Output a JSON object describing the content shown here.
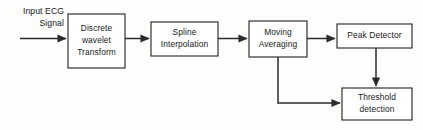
{
  "diagram": {
    "type": "flowchart",
    "background_color": "#fdfdfc",
    "line_color": "#2b2b2b",
    "text_color": "#181818",
    "source": {
      "name": "input-signal-label",
      "line1": "Input ECG",
      "line2": "Signal"
    },
    "blocks": [
      {
        "id": "discrete-wavelet-transform",
        "line1": "Discrete",
        "line2": "wavelet",
        "line3": "Transform",
        "x": 68,
        "y": 14,
        "w": 57,
        "h": 54
      },
      {
        "id": "spline-interpolation",
        "line1": "Spline",
        "line2": "Interpolation",
        "line3": "",
        "x": 151,
        "y": 22,
        "w": 67,
        "h": 34
      },
      {
        "id": "moving-averaging",
        "line1": "Moving",
        "line2": "Averaging",
        "line3": "",
        "x": 249,
        "y": 21,
        "w": 58,
        "h": 36
      },
      {
        "id": "peak-detector",
        "line1": "Peak Detector",
        "line2": "",
        "line3": "",
        "x": 337,
        "y": 24,
        "w": 75,
        "h": 24
      },
      {
        "id": "threshold-detection",
        "line1": "Threshold",
        "line2": "detection",
        "line3": "",
        "x": 342,
        "y": 88,
        "w": 70,
        "h": 32
      }
    ],
    "connections": [
      {
        "id": "input-to-dwt",
        "from": "input",
        "to": "discrete-wavelet-transform"
      },
      {
        "id": "dwt-to-spline",
        "from": "discrete-wavelet-transform",
        "to": "spline-interpolation"
      },
      {
        "id": "spline-to-moving-averaging",
        "from": "spline-interpolation",
        "to": "moving-averaging"
      },
      {
        "id": "moving-averaging-to-peak-detector",
        "from": "moving-averaging",
        "to": "peak-detector"
      },
      {
        "id": "peak-detector-to-threshold",
        "from": "peak-detector",
        "to": "threshold-detection"
      },
      {
        "id": "moving-averaging-to-threshold",
        "from": "moving-averaging",
        "to": "threshold-detection"
      }
    ]
  }
}
